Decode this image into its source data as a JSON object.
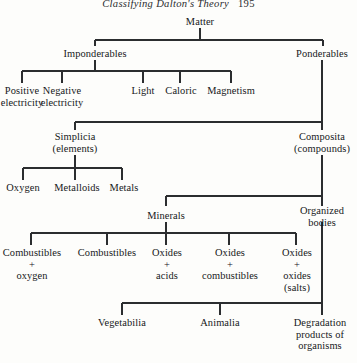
{
  "page": {
    "running_head": "Classifying Dalton's Theory",
    "page_number": "195"
  },
  "diagram": {
    "type": "hierarchy-tree",
    "line_color": "#2b2d2f",
    "text_color": "#16181a",
    "nodes": {
      "matter": "Matter",
      "imponderables": "Imponderables",
      "ponderables": "Ponderables",
      "positive_electricity": "Positive\nelectricity",
      "negative_electricity": "Negative\nelectricity",
      "light": "Light",
      "caloric": "Caloric",
      "magnetism": "Magnetism",
      "simplicia": "Simplicia\n(elements)",
      "composita": "Composita\n(compounds)",
      "oxygen": "Oxygen",
      "metalloids": "Metalloids",
      "metals": "Metals",
      "minerals": "Minerals",
      "organized_bodies": "Organized\nbodies",
      "combustibles_oxygen": "Combustibles\n+\noxygen",
      "combustibles": "Combustibles",
      "oxides_acids": "Oxides\n+\nacids",
      "oxides_combustibles": "Oxides\n+\ncombustibles",
      "oxides_oxides_salts": "Oxides\n+\noxides\n(salts)",
      "vegetabilia": "Vegetabilia",
      "animalia": "Animalia",
      "degradation_products": "Degradation\nproducts of\norganisms"
    }
  }
}
